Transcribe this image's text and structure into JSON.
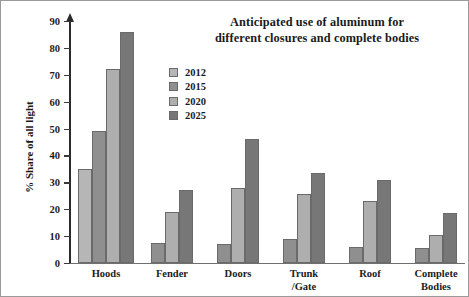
{
  "chart_data": {
    "type": "bar",
    "title": "Anticipated use of aluminum for different closures and complete bodies",
    "title_line1": "Anticipated use of aluminum for",
    "title_line2": "different closures and complete bodies",
    "xlabel": "",
    "ylabel": "% Share of all light",
    "ylim": [
      0,
      90
    ],
    "ytick_step": 10,
    "yticks": [
      0,
      10,
      20,
      30,
      40,
      50,
      60,
      70,
      80,
      90
    ],
    "grid": false,
    "legend_position": "top-center-inside",
    "categories": [
      "Hoods",
      "Fender",
      "Doors",
      "Trunk /Gate",
      "Roof",
      "Complete Bodies"
    ],
    "category_labels": [
      {
        "line1": "Hoods",
        "line2": ""
      },
      {
        "line1": "Fender",
        "line2": ""
      },
      {
        "line1": "Doors",
        "line2": ""
      },
      {
        "line1": "Trunk",
        "line2": "/Gate"
      },
      {
        "line1": "Roof",
        "line2": ""
      },
      {
        "line1": "Complete",
        "line2": "Bodies"
      }
    ],
    "series": [
      {
        "name": "2012",
        "color": "#b6b6b6",
        "values": [
          35,
          0,
          0,
          0,
          0,
          0
        ]
      },
      {
        "name": "2015",
        "color": "#8f8f8f",
        "values": [
          49,
          7.5,
          7,
          9,
          6,
          5.5
        ]
      },
      {
        "name": "2020",
        "color": "#aeaeae",
        "values": [
          72,
          19,
          28,
          25.5,
          23,
          10.5
        ]
      },
      {
        "name": "2025",
        "color": "#777777",
        "values": [
          86,
          27,
          46,
          33.5,
          31,
          18.5
        ]
      }
    ]
  },
  "legend": {
    "items": [
      {
        "label": "2012",
        "color": "#b6b6b6"
      },
      {
        "label": "2015",
        "color": "#8f8f8f"
      },
      {
        "label": "2020",
        "color": "#aeaeae"
      },
      {
        "label": "2025",
        "color": "#777777"
      }
    ]
  }
}
